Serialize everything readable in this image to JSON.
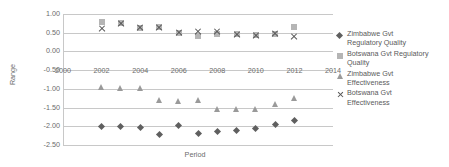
{
  "chart_data": {
    "type": "scatter",
    "title": "",
    "xlabel": "Period",
    "ylabel": "Range",
    "xlim": [
      2000,
      2014
    ],
    "ylim": [
      -2.5,
      1.0
    ],
    "xticks": [
      "2000",
      "2002",
      "2004",
      "2006",
      "2008",
      "2010",
      "2012",
      "2014"
    ],
    "yticks": [
      "1.00",
      "0.50",
      "0.00",
      "-0.50",
      "-1.00",
      "-1.50",
      "-2.00",
      "-2.50"
    ],
    "grid": true,
    "legend_position": "right",
    "x": [
      2002,
      2003,
      2004,
      2005,
      2006,
      2007,
      2008,
      2009,
      2010,
      2011,
      2012
    ],
    "series": [
      {
        "name": "Zimbabwe Gvt Regulatory Quality",
        "marker": "diamond",
        "color": "#5f5f5f",
        "values": [
          -2.0,
          -2.0,
          -2.04,
          -2.22,
          -1.98,
          -2.18,
          -2.14,
          -2.11,
          -2.07,
          -1.94,
          -1.85
        ]
      },
      {
        "name": "Botswana Gvt Regulatory Quality",
        "marker": "square",
        "color": "#b5b5b5",
        "values": [
          0.78,
          0.76,
          0.63,
          0.64,
          0.5,
          0.41,
          0.47,
          0.46,
          0.43,
          0.47,
          0.66
        ]
      },
      {
        "name": "Zimbabwe Gvt Effectiveness",
        "marker": "triangle",
        "color": "#9a9a9a",
        "values": [
          -0.94,
          -0.98,
          -0.99,
          -1.31,
          -1.33,
          -1.29,
          -1.53,
          -1.55,
          -1.53,
          -1.41,
          -1.24
        ]
      },
      {
        "name": "Botswana Gvt Effectiveness",
        "marker": "x",
        "color": "#555555",
        "values": [
          0.61,
          0.75,
          0.63,
          0.64,
          0.49,
          0.54,
          0.52,
          0.46,
          0.43,
          0.47,
          0.4
        ]
      }
    ]
  },
  "legend": {
    "items": [
      {
        "label_line1": "Zimbabwe Gvt",
        "label_line2": "Regulatory Quality",
        "marker": "diamond-marker-icon"
      },
      {
        "label_line1": "Botswana Gvt Regulatory",
        "label_line2": "Quality",
        "marker": "square-marker-icon"
      },
      {
        "label_line1": "Zimbabwe Gvt",
        "label_line2": "Effectiveness",
        "marker": "triangle-marker-icon"
      },
      {
        "label_line1": "Botswana Gvt",
        "label_line2": "Effectiveness",
        "marker": "x-marker-icon"
      }
    ]
  }
}
